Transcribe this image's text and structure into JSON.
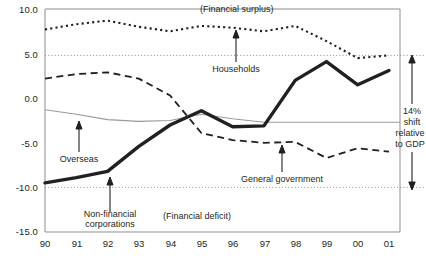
{
  "chart_data": {
    "type": "line",
    "title": "",
    "xlabel": "",
    "ylabel": "",
    "x": [
      "90",
      "91",
      "92",
      "93",
      "94",
      "95",
      "96",
      "97",
      "98",
      "99",
      "00",
      "01"
    ],
    "xlim": [
      1990,
      2001
    ],
    "ylim": [
      -15.0,
      10.0
    ],
    "ytick_labels": [
      "10.0",
      "5.0",
      "0.0",
      "-5.0",
      "-10.0",
      "-15.0"
    ],
    "ytick_values": [
      10.0,
      5.0,
      0.0,
      -5.0,
      -10.0,
      -15.0
    ],
    "grid": false,
    "legend": "inline-annotations",
    "gridlines_dotted": [
      4.8,
      -10.0
    ],
    "series": [
      {
        "name": "Households",
        "style": "dotted",
        "color": "#231f20",
        "values": [
          7.7,
          8.3,
          8.7,
          8.0,
          7.5,
          8.1,
          7.9,
          7.5,
          8.1,
          6.4,
          4.5,
          4.8
        ]
      },
      {
        "name": "General government",
        "style": "dashed",
        "color": "#231f20",
        "values": [
          2.2,
          2.7,
          2.9,
          2.2,
          0.3,
          -3.9,
          -4.7,
          -5.0,
          -4.9,
          -6.7,
          -5.6,
          -6.0
        ]
      },
      {
        "name": "Overseas",
        "style": "thin-solid",
        "color": "#9a9a9a",
        "values": [
          -1.3,
          -1.8,
          -2.4,
          -2.6,
          -2.5,
          -1.8,
          -2.3,
          -2.7,
          -2.7,
          -2.7,
          -2.7,
          -2.7
        ]
      },
      {
        "name": "Non-financial corporations",
        "style": "thick-solid",
        "color": "#231f20",
        "values": [
          -9.5,
          -8.9,
          -8.2,
          -5.4,
          -3.0,
          -1.4,
          -3.2,
          -3.1,
          2.0,
          4.1,
          1.5,
          3.1
        ]
      }
    ],
    "annotations": [
      {
        "name": "financial-surplus",
        "text": "(Financial surplus)"
      },
      {
        "name": "financial-deficit",
        "text": "(Financial deficit)"
      },
      {
        "name": "households",
        "text": "Households"
      },
      {
        "name": "overseas",
        "text": "Overseas"
      },
      {
        "name": "non-financial-corporations-line1",
        "text": "Non-financial"
      },
      {
        "name": "non-financial-corporations-line2",
        "text": "corporations"
      },
      {
        "name": "general-government",
        "text": "General government"
      },
      {
        "name": "shift-line1",
        "text": "14%"
      },
      {
        "name": "shift-line2",
        "text": "shift"
      },
      {
        "name": "shift-line3",
        "text": "relative"
      },
      {
        "name": "shift-line4",
        "text": "to GDP"
      }
    ]
  },
  "axis": {
    "y": {
      "t0": "10.0",
      "t1": "5.0",
      "t2": "0.0",
      "t3": "-5.0",
      "t4": "-10.0",
      "t5": "-15.0"
    },
    "x": {
      "t0": "90",
      "t1": "91",
      "t2": "92",
      "t3": "93",
      "t4": "94",
      "t5": "95",
      "t6": "96",
      "t7": "97",
      "t8": "98",
      "t9": "99",
      "t10": "00",
      "t11": "01"
    }
  },
  "labels": {
    "financial_surplus": "(Financial surplus)",
    "financial_deficit": "(Financial deficit)",
    "households": "Households",
    "overseas": "Overseas",
    "nfc_l1": "Non-financial",
    "nfc_l2": "corporations",
    "general_government": "General government",
    "shift_l1": "14%",
    "shift_l2": "shift",
    "shift_l3": "relative",
    "shift_l4": "to GDP"
  },
  "colors": {
    "ink": "#231f20",
    "grey_line": "#9a9a9a",
    "frame": "#8d8d8d",
    "dotted_grid": "#9a9a9a"
  }
}
